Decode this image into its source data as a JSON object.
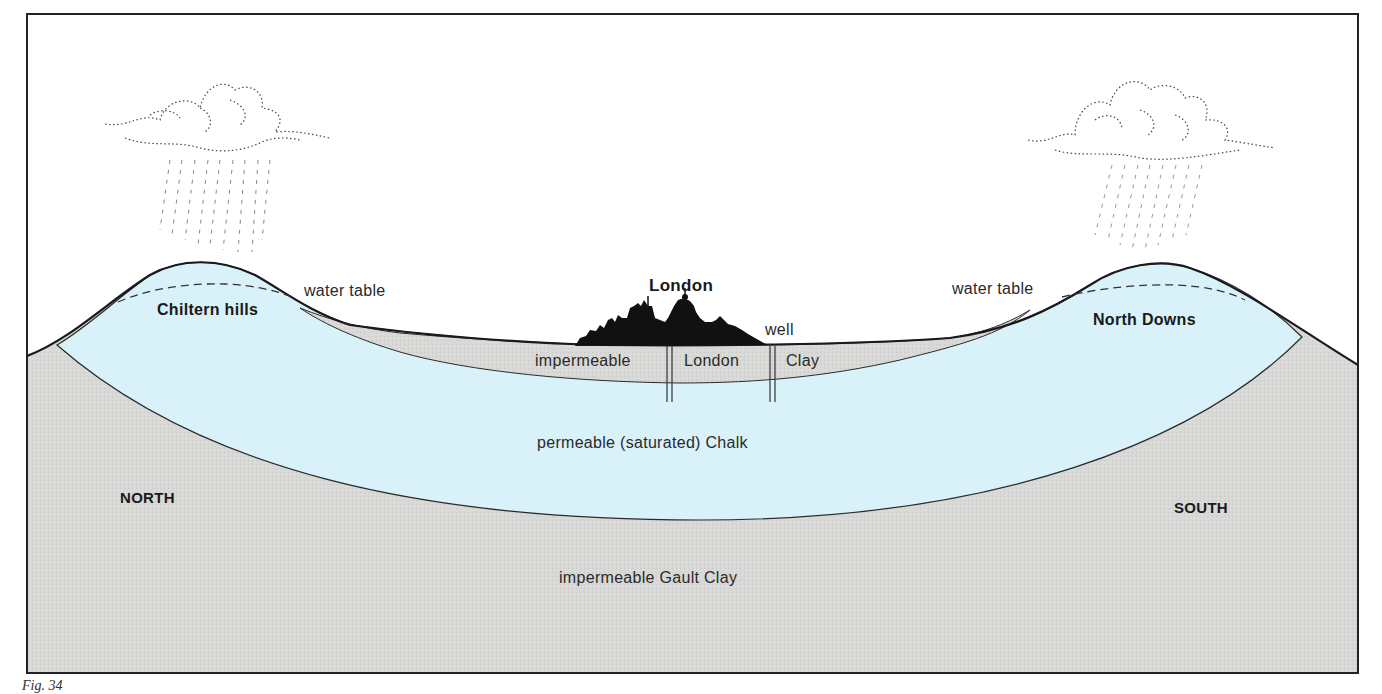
{
  "diagram": {
    "colors": {
      "sky": "#ffffff",
      "chalk_saturated": "#d9f1f8",
      "clay": "#d7d7d5",
      "outline": "#1e1e1e",
      "frame": "#2a2a2a"
    },
    "labels": {
      "city": "London",
      "water_table_left": "water table",
      "water_table_right": "water table",
      "hills_left": "Chiltern hills",
      "hills_right": "North Downs",
      "well": "well",
      "london_clay_1": "impermeable",
      "london_clay_2": "London",
      "london_clay_3": "Clay",
      "chalk": "permeable (saturated) Chalk",
      "gault": "impermeable Gault Clay",
      "north": "NORTH",
      "south": "SOUTH"
    },
    "icons": [
      "rain-cloud-icon-left",
      "rain-cloud-icon-right",
      "city-skyline-icon",
      "well-icon-left",
      "well-icon-right"
    ],
    "caption": "Fig. 34"
  }
}
